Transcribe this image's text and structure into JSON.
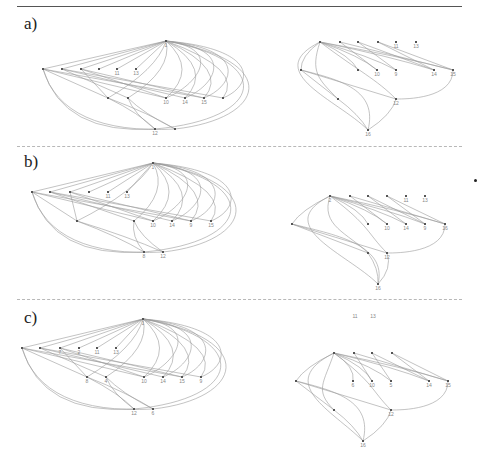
{
  "figure": {
    "panels": [
      {
        "label": "a)",
        "label_y": 22,
        "left_graph": {
          "root": {
            "id": "1",
            "x": 166,
            "y": 41
          },
          "row1": [
            {
              "id": "",
              "x": 43,
              "y": 69
            },
            {
              "id": "",
              "x": 62,
              "y": 69
            },
            {
              "id": "",
              "x": 81,
              "y": 69
            },
            {
              "id": "",
              "x": 99,
              "y": 69
            },
            {
              "id": "11",
              "x": 117,
              "y": 69
            },
            {
              "id": "13",
              "x": 136,
              "y": 69
            }
          ],
          "row2": [
            {
              "id": "",
              "x": 108,
              "y": 98
            },
            {
              "id": "",
              "x": 128,
              "y": 98
            },
            {
              "id": "10",
              "x": 166,
              "y": 98
            },
            {
              "id": "14",
              "x": 185,
              "y": 98
            },
            {
              "id": "15",
              "x": 204,
              "y": 98
            },
            {
              "id": "",
              "x": 223,
              "y": 98
            }
          ],
          "row3": [
            {
              "id": "12",
              "x": 155,
              "y": 129
            },
            {
              "id": "",
              "x": 175,
              "y": 129
            }
          ]
        },
        "right_graph": {
          "top": [
            {
              "id": "",
              "x": 320,
              "y": 42
            },
            {
              "id": "",
              "x": 340,
              "y": 42
            },
            {
              "id": "",
              "x": 358,
              "y": 42
            },
            {
              "id": "",
              "x": 378,
              "y": 42
            },
            {
              "id": "11",
              "x": 396,
              "y": 42
            },
            {
              "id": "13",
              "x": 416,
              "y": 42
            }
          ],
          "mid": [
            {
              "id": "",
              "x": 301,
              "y": 70
            },
            {
              "id": "",
              "x": 358,
              "y": 70
            },
            {
              "id": "10",
              "x": 377,
              "y": 70
            },
            {
              "id": "9",
              "x": 396,
              "y": 70
            },
            {
              "id": "14",
              "x": 434,
              "y": 70
            },
            {
              "id": "15",
              "x": 453,
              "y": 70
            }
          ],
          "low": [
            {
              "id": "",
              "x": 338,
              "y": 99
            },
            {
              "id": "12",
              "x": 396,
              "y": 99
            }
          ],
          "bottom": [
            {
              "id": "16",
              "x": 368,
              "y": 130
            }
          ]
        }
      },
      {
        "label": "b)",
        "label_y": 160,
        "left_graph": {
          "root": {
            "id": "1",
            "x": 153,
            "y": 163
          },
          "row1": [
            {
              "id": "",
              "x": 32,
              "y": 192
            },
            {
              "id": "",
              "x": 50,
              "y": 192
            },
            {
              "id": "",
              "x": 70,
              "y": 192
            },
            {
              "id": "",
              "x": 89,
              "y": 192
            },
            {
              "id": "11",
              "x": 108,
              "y": 192
            },
            {
              "id": "13",
              "x": 127,
              "y": 192
            }
          ],
          "row2": [
            {
              "id": "",
              "x": 77,
              "y": 221
            },
            {
              "id": "",
              "x": 134,
              "y": 221
            },
            {
              "id": "10",
              "x": 153,
              "y": 221
            },
            {
              "id": "14",
              "x": 172,
              "y": 221
            },
            {
              "id": "9",
              "x": 191,
              "y": 221
            },
            {
              "id": "15",
              "x": 211,
              "y": 221
            }
          ],
          "row3": [
            {
              "id": "8",
              "x": 144,
              "y": 252
            },
            {
              "id": "12",
              "x": 163,
              "y": 252
            }
          ]
        },
        "right_graph": {
          "top": [
            {
              "id": "2",
              "x": 330,
              "y": 196
            },
            {
              "id": "",
              "x": 350,
              "y": 196
            },
            {
              "id": "",
              "x": 368,
              "y": 196
            },
            {
              "id": "",
              "x": 387,
              "y": 196
            },
            {
              "id": "11",
              "x": 406,
              "y": 196
            },
            {
              "id": "13",
              "x": 425,
              "y": 196
            }
          ],
          "mid": [
            {
              "id": "",
              "x": 292,
              "y": 224
            },
            {
              "id": "",
              "x": 368,
              "y": 224
            },
            {
              "id": "10",
              "x": 387,
              "y": 224
            },
            {
              "id": "14",
              "x": 406,
              "y": 224
            },
            {
              "id": "9",
              "x": 425,
              "y": 224
            },
            {
              "id": "16",
              "x": 445,
              "y": 224
            }
          ],
          "low": [
            {
              "id": "",
              "x": 368,
              "y": 253
            },
            {
              "id": "12",
              "x": 387,
              "y": 253
            }
          ],
          "bottom": [
            {
              "id": "16",
              "x": 378,
              "y": 284
            }
          ]
        }
      },
      {
        "label": "c)",
        "label_y": 316,
        "left_graph": {
          "root": {
            "id": "1",
            "x": 143,
            "y": 319
          },
          "row1": [
            {
              "id": "",
              "x": 22,
              "y": 348
            },
            {
              "id": "",
              "x": 40,
              "y": 348
            },
            {
              "id": "7",
              "x": 60,
              "y": 348
            },
            {
              "id": "2",
              "x": 79,
              "y": 348
            },
            {
              "id": "11",
              "x": 97,
              "y": 348
            },
            {
              "id": "13",
              "x": 116,
              "y": 348
            }
          ],
          "row2": [
            {
              "id": "8",
              "x": 87,
              "y": 377
            },
            {
              "id": "4",
              "x": 106,
              "y": 377
            },
            {
              "id": "10",
              "x": 144,
              "y": 377
            },
            {
              "id": "14",
              "x": 163,
              "y": 377
            },
            {
              "id": "15",
              "x": 182,
              "y": 377
            },
            {
              "id": "9",
              "x": 201,
              "y": 377
            }
          ],
          "row3": [
            {
              "id": "12",
              "x": 134,
              "y": 409
            },
            {
              "id": "6",
              "x": 153,
              "y": 409
            }
          ]
        },
        "right_graph": {
          "top": [
            {
              "id": "",
              "x": 334,
              "y": 353
            },
            {
              "id": "",
              "x": 354,
              "y": 353
            },
            {
              "id": "",
              "x": 372,
              "y": 353
            },
            {
              "id": "",
              "x": 392,
              "y": 353
            }
          ],
          "floating": [
            {
              "id": "11",
              "x": 355,
              "y": 318
            },
            {
              "id": "13",
              "x": 373,
              "y": 318
            }
          ],
          "mid": [
            {
              "id": "",
              "x": 296,
              "y": 381
            },
            {
              "id": "6",
              "x": 353,
              "y": 381
            },
            {
              "id": "10",
              "x": 372,
              "y": 381
            },
            {
              "id": "5",
              "x": 391,
              "y": 381
            },
            {
              "id": "14",
              "x": 429,
              "y": 381
            },
            {
              "id": "15",
              "x": 448,
              "y": 381
            }
          ],
          "low": [
            {
              "id": "",
              "x": 334,
              "y": 410
            },
            {
              "id": "12",
              "x": 391,
              "y": 410
            }
          ],
          "bottom": [
            {
              "id": "16",
              "x": 363,
              "y": 441
            }
          ]
        }
      }
    ],
    "separators_y": [
      146,
      299
    ],
    "header_rule_y": 6,
    "stray_dot": {
      "x": 475,
      "y": 180
    }
  }
}
